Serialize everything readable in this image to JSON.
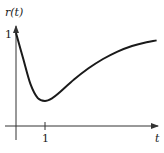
{
  "chart_data": {
    "type": "line",
    "title": "",
    "xlabel": "t",
    "ylabel": "r(t)",
    "x_ticks": [
      {
        "value": 1,
        "label": "1"
      }
    ],
    "y_ticks": [
      {
        "value": 1,
        "label": "1"
      }
    ],
    "xlim": [
      -0.3,
      4.9
    ],
    "ylim": [
      0,
      1.15
    ],
    "grid": false,
    "legend": null,
    "series": [
      {
        "name": "r(t)",
        "x": [
          0,
          0.25,
          0.5,
          0.75,
          1.0,
          1.25,
          1.5,
          2.0,
          2.5,
          3.0,
          3.5,
          4.0,
          4.5,
          4.85
        ],
        "y": [
          1.0,
          0.72,
          0.45,
          0.3,
          0.27,
          0.3,
          0.36,
          0.5,
          0.62,
          0.72,
          0.8,
          0.86,
          0.9,
          0.92
        ]
      }
    ],
    "colors": {
      "curve": "#1a1a1a",
      "axes": "#333333"
    }
  },
  "labels": {
    "y_axis": "r(t)",
    "x_axis": "t",
    "x_tick_1": "1",
    "y_tick_1": "1"
  }
}
